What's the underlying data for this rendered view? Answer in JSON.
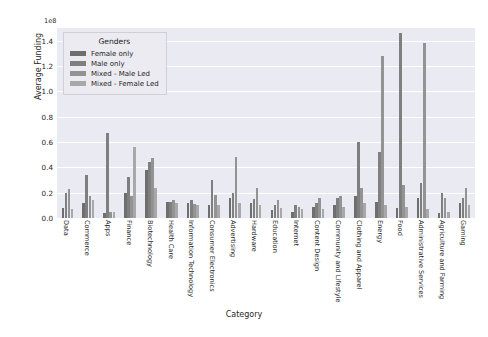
{
  "chart": {
    "type": "bar",
    "title": "",
    "xlabel": "Category",
    "ylabel": "Average Funding",
    "exponent_label": "1e8",
    "legend_title": "Genders",
    "legend_position": "upper-left-inside",
    "grid": true,
    "ylim": [
      0,
      1.5
    ],
    "yticks": [
      "0.0",
      "0.2",
      "0.4",
      "0.6",
      "0.8",
      "1.0",
      "1.2",
      "1.4"
    ],
    "ytick_values": [
      0.0,
      0.2,
      0.4,
      0.6,
      0.8,
      1.0,
      1.2,
      1.4
    ],
    "plot_background": "#eaeaf2",
    "grid_color": "#ffffff",
    "categories": [
      "Data",
      "Commerce",
      "Apps",
      "Finance",
      "Biotechnology",
      "Health Care",
      "Information Technology",
      "Consumer Electronics",
      "Advertising",
      "Hardware",
      "Education",
      "Internet",
      "Content Design",
      "Community and Lifestyle",
      "Clothing and Apparel",
      "Energy",
      "Food",
      "Administrative Services",
      "Agriculture and Farming",
      "Gaming"
    ],
    "series": [
      {
        "name": "Female only",
        "color": "#6e6e6e",
        "values": [
          0.08,
          0.12,
          0.04,
          0.2,
          0.38,
          0.13,
          0.12,
          0.1,
          0.16,
          0.12,
          0.06,
          0.05,
          0.09,
          0.1,
          0.17,
          0.13,
          0.08,
          0.16,
          0.04,
          0.12
        ]
      },
      {
        "name": "Male only",
        "color": "#7f7f7f",
        "values": [
          0.2,
          0.34,
          0.67,
          0.32,
          0.44,
          0.13,
          0.14,
          0.3,
          0.2,
          0.15,
          0.1,
          0.1,
          0.12,
          0.16,
          0.6,
          0.52,
          1.46,
          0.28,
          0.2,
          0.16
        ]
      },
      {
        "name": "Mixed - Male Led",
        "color": "#939393",
        "values": [
          0.23,
          0.17,
          0.05,
          0.17,
          0.47,
          0.14,
          0.11,
          0.18,
          0.48,
          0.24,
          0.14,
          0.09,
          0.16,
          0.17,
          0.24,
          1.28,
          0.26,
          1.38,
          0.16,
          0.24
        ]
      },
      {
        "name": "Mixed - Female Led",
        "color": "#a8a8a8",
        "values": [
          0.07,
          0.14,
          0.05,
          0.56,
          0.24,
          0.12,
          0.1,
          0.1,
          0.12,
          0.1,
          0.08,
          0.07,
          0.07,
          0.09,
          0.12,
          0.1,
          0.09,
          0.07,
          0.05,
          0.1
        ]
      }
    ]
  }
}
